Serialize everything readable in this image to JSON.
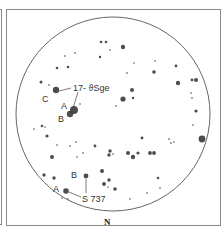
{
  "chart": {
    "orientation_label": "N",
    "field_circle": {
      "cx": 113,
      "cy": 114,
      "r": 97
    },
    "colors": {
      "star": "#3a3a3a",
      "circle": "#555555",
      "frame": "#8a8a8a",
      "text": "#333333"
    }
  },
  "labels": {
    "target1": "17- ϑSge",
    "target1_c": "C",
    "target1_a": "A",
    "target1_b": "B",
    "target2": "S 737",
    "target2_a": "A",
    "target2_b": "B"
  },
  "stars": [
    {
      "x": 101,
      "y": 42,
      "r": 1.3
    },
    {
      "x": 106,
      "y": 42,
      "r": 1.3
    },
    {
      "x": 123,
      "y": 47,
      "r": 2.2
    },
    {
      "x": 110,
      "y": 50,
      "r": 0.9
    },
    {
      "x": 75,
      "y": 53,
      "r": 1.1
    },
    {
      "x": 65,
      "y": 56,
      "r": 1.0
    },
    {
      "x": 100,
      "y": 57,
      "r": 1.2
    },
    {
      "x": 155,
      "y": 61,
      "r": 1.0
    },
    {
      "x": 134,
      "y": 63,
      "r": 0.9
    },
    {
      "x": 176,
      "y": 66,
      "r": 1.4
    },
    {
      "x": 57,
      "y": 68,
      "r": 1.3
    },
    {
      "x": 68,
      "y": 67,
      "r": 1.3
    },
    {
      "x": 154,
      "y": 72,
      "r": 1.8
    },
    {
      "x": 127,
      "y": 73,
      "r": 1.1
    },
    {
      "x": 41,
      "y": 82,
      "r": 1.5
    },
    {
      "x": 49,
      "y": 85,
      "r": 1.1
    },
    {
      "x": 192,
      "y": 80,
      "r": 1.4
    },
    {
      "x": 196,
      "y": 80,
      "r": 2.0
    },
    {
      "x": 178,
      "y": 83,
      "r": 2.2
    },
    {
      "x": 56,
      "y": 90,
      "r": 3.2
    },
    {
      "x": 132,
      "y": 90,
      "r": 2.0
    },
    {
      "x": 191,
      "y": 93,
      "r": 1.0
    },
    {
      "x": 192,
      "y": 98,
      "r": 1.1
    },
    {
      "x": 123,
      "y": 99,
      "r": 2.6
    },
    {
      "x": 133,
      "y": 98,
      "r": 1.2
    },
    {
      "x": 80,
      "y": 104,
      "r": 1.0
    },
    {
      "x": 116,
      "y": 106,
      "r": 1.0
    },
    {
      "x": 74,
      "y": 110,
      "r": 4.0
    },
    {
      "x": 70,
      "y": 114,
      "r": 3.2
    },
    {
      "x": 196,
      "y": 111,
      "r": 1.6
    },
    {
      "x": 193,
      "y": 125,
      "r": 1.0
    },
    {
      "x": 34,
      "y": 129,
      "r": 1.0
    },
    {
      "x": 42,
      "y": 126,
      "r": 1.3
    },
    {
      "x": 45,
      "y": 127,
      "r": 0.9
    },
    {
      "x": 47,
      "y": 136,
      "r": 1.6
    },
    {
      "x": 142,
      "y": 138,
      "r": 1.4
    },
    {
      "x": 169,
      "y": 139,
      "r": 1.1
    },
    {
      "x": 171,
      "y": 143,
      "r": 1.1
    },
    {
      "x": 174,
      "y": 142,
      "r": 0.9
    },
    {
      "x": 202,
      "y": 139,
      "r": 3.4
    },
    {
      "x": 57,
      "y": 145,
      "r": 1.0
    },
    {
      "x": 76,
      "y": 142,
      "r": 1.0
    },
    {
      "x": 70,
      "y": 146,
      "r": 1.0
    },
    {
      "x": 95,
      "y": 146,
      "r": 1.4
    },
    {
      "x": 110,
      "y": 151,
      "r": 1.7
    },
    {
      "x": 109,
      "y": 155,
      "r": 1.7
    },
    {
      "x": 113,
      "y": 154,
      "r": 1.0
    },
    {
      "x": 128,
      "y": 153,
      "r": 2.0
    },
    {
      "x": 138,
      "y": 153,
      "r": 1.6
    },
    {
      "x": 133,
      "y": 157,
      "r": 2.2
    },
    {
      "x": 150,
      "y": 153,
      "r": 1.9
    },
    {
      "x": 154,
      "y": 153,
      "r": 1.9
    },
    {
      "x": 83,
      "y": 153,
      "r": 1.1
    },
    {
      "x": 77,
      "y": 157,
      "r": 0.9
    },
    {
      "x": 52,
      "y": 157,
      "r": 2.0
    },
    {
      "x": 44,
      "y": 175,
      "r": 1.7
    },
    {
      "x": 54,
      "y": 178,
      "r": 1.7
    },
    {
      "x": 86,
      "y": 176,
      "r": 2.4
    },
    {
      "x": 102,
      "y": 171,
      "r": 2.0
    },
    {
      "x": 109,
      "y": 180,
      "r": 1.7
    },
    {
      "x": 104,
      "y": 184,
      "r": 1.9
    },
    {
      "x": 108,
      "y": 187,
      "r": 0.9
    },
    {
      "x": 115,
      "y": 189,
      "r": 1.8
    },
    {
      "x": 158,
      "y": 178,
      "r": 1.3
    },
    {
      "x": 160,
      "y": 188,
      "r": 1.1
    },
    {
      "x": 147,
      "y": 193,
      "r": 1.0
    },
    {
      "x": 130,
      "y": 199,
      "r": 1.0
    },
    {
      "x": 66,
      "y": 191,
      "r": 2.8
    },
    {
      "x": 62,
      "y": 198,
      "r": 0.9
    },
    {
      "x": 68,
      "y": 199,
      "r": 0.9
    }
  ]
}
